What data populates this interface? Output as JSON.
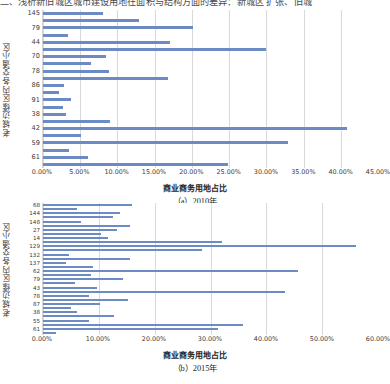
{
  "page": {
    "clipped_top_line": "二、浅析新旧城区城市建设用地在面积与结构方面的差异：新城区 扩张、旧城"
  },
  "chart_data": [
    {
      "type": "bar",
      "orientation": "horizontal",
      "id": "chart-a",
      "caption": "（a）2010年",
      "title": "",
      "xlabel": "商业商务用地占比",
      "ylabel": "老城边缘区内各交通小区",
      "xlim": [
        0,
        45
      ],
      "xtick_labels": [
        "0.00%",
        "5.00%",
        "10.00%",
        "15.00%",
        "20.00%",
        "25.00%",
        "30.00%",
        "35.00%",
        "40.00%",
        "45.00%"
      ],
      "xticks": [
        0,
        5,
        10,
        15,
        20,
        25,
        30,
        35,
        40,
        45
      ],
      "grid": true,
      "legend": "none",
      "bar_color": "#6c8ac4",
      "axis_label_interval": 2,
      "categories": [
        "145",
        "",
        "79",
        "",
        "44",
        "",
        "70",
        "",
        "78",
        "",
        "86",
        "",
        "91",
        "",
        "38",
        "",
        "42",
        "",
        "59",
        "",
        "61",
        ""
      ],
      "values": [
        8.0,
        12.9,
        20.1,
        3.4,
        17.0,
        30.0,
        8.5,
        6.4,
        8.9,
        16.8,
        2.8,
        2.1,
        3.8,
        2.7,
        3.1,
        9.0,
        40.9,
        5.1,
        32.9,
        3.5,
        6.0,
        24.9
      ]
    },
    {
      "type": "bar",
      "orientation": "horizontal",
      "id": "chart-b",
      "caption": "（b）2015年",
      "title": "",
      "xlabel": "商业商务用地占比",
      "ylabel": "老城边缘区内各交通小区",
      "xlim": [
        0,
        60
      ],
      "xtick_labels": [
        "0.00%",
        "10.00%",
        "20.00%",
        "30.00%",
        "40.00%",
        "50.00%",
        "60.00%"
      ],
      "xticks": [
        0,
        10,
        20,
        30,
        40,
        50,
        60
      ],
      "grid": true,
      "legend": "none",
      "bar_color": "#6c8ac4",
      "axis_label_interval": 2,
      "categories": [
        "68",
        "",
        "144",
        "",
        "148",
        "",
        "27",
        "",
        "14",
        "",
        "129",
        "",
        "132",
        "",
        "137",
        "",
        "62",
        "",
        "79",
        "",
        "43",
        "",
        "78",
        "",
        "87",
        "",
        "38",
        "",
        "55",
        "",
        "61",
        ""
      ],
      "values": [
        16.0,
        6.0,
        13.8,
        12.5,
        6.8,
        15.5,
        13.2,
        10.4,
        11.6,
        32.0,
        56.0,
        28.4,
        4.6,
        15.6,
        4.2,
        9.0,
        45.6,
        8.6,
        14.4,
        5.8,
        9.6,
        43.4,
        8.2,
        15.2,
        10.2,
        5.0,
        6.0,
        12.7,
        8.2,
        35.8,
        31.4,
        2.4
      ]
    }
  ]
}
